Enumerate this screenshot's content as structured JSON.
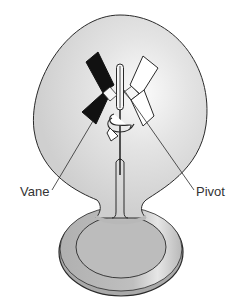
{
  "diagram": {
    "labels": {
      "vane": "Vane",
      "pivot": "Pivot"
    },
    "colors": {
      "glass": "#d6d6d6",
      "glass_highlight": "#f2f2f2",
      "base": "#b9b9b9",
      "outline": "#2a2a2a",
      "vane_dark": "#111111",
      "vane_light": "#ffffff",
      "label_text": "#333333"
    },
    "icons": {
      "rotation": "rotation-arrow-icon"
    }
  }
}
